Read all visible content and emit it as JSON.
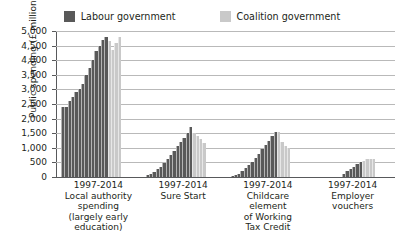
{
  "chart_data": {
    "type": "bar",
    "title": "",
    "subtitle": "",
    "xlabel": "",
    "ylabel": "Public spending (£ millions)",
    "ylim": [
      0,
      5000
    ],
    "ytick_step": 500,
    "grid": true,
    "legend_position": "top-center",
    "period_label": "1997-2014",
    "categories": [
      "Local authority spending (largely early education)",
      "Sure Start",
      "Childcare element of Working Tax Credit",
      "Employer vouchers"
    ],
    "category_lines": [
      [
        "Local authority",
        "spending",
        "(largely early",
        "education)"
      ],
      [
        "Sure Start"
      ],
      [
        "Childcare",
        "element",
        "of Working",
        "Tax Credit"
      ],
      [
        "Employer",
        "vouchers"
      ]
    ],
    "series": [
      {
        "name": "Labour government",
        "color": "#595959",
        "years": [
          1997,
          1998,
          1999,
          2000,
          2001,
          2002,
          2003,
          2004,
          2005,
          2006,
          2007,
          2008,
          2009,
          2010
        ]
      },
      {
        "name": "Coalition government",
        "color": "#c9c9c9",
        "years": [
          2011,
          2012,
          2013,
          2014
        ]
      }
    ],
    "groups": [
      {
        "category": "Local authority spending (largely early education)",
        "labour_values": [
          2400,
          2400,
          2600,
          2750,
          2900,
          3000,
          3200,
          3500,
          3750,
          4000,
          4300,
          4500,
          4700,
          4800
        ],
        "coalition_values": [
          4650,
          4350,
          4600,
          4800
        ]
      },
      {
        "category": "Sure Start",
        "labour_values": [
          60,
          110,
          180,
          260,
          360,
          470,
          600,
          760,
          900,
          1050,
          1200,
          1350,
          1500,
          1700
        ],
        "coalition_values": [
          1500,
          1400,
          1300,
          1150
        ]
      },
      {
        "category": "Childcare element of Working Tax Credit",
        "labour_values": [
          30,
          60,
          120,
          200,
          300,
          400,
          520,
          650,
          800,
          950,
          1100,
          1250,
          1400,
          1550
        ],
        "coalition_values": [
          1550,
          1200,
          1050,
          1000
        ]
      },
      {
        "category": "Employer vouchers",
        "labour_values": [
          0,
          0,
          0,
          0,
          0,
          0,
          0,
          0,
          120,
          200,
          280,
          360,
          430,
          500
        ],
        "coalition_values": [
          560,
          600,
          620,
          620
        ]
      }
    ],
    "yticks": [
      "0",
      "500",
      "1,000",
      "1,500",
      "2,000",
      "2,500",
      "3,000",
      "3,500",
      "4,000",
      "4,500",
      "5,000"
    ]
  },
  "legend": {
    "entries": [
      {
        "label": "Labour government",
        "color": "#595959"
      },
      {
        "label": "Coalition government",
        "color": "#c9c9c9"
      }
    ]
  }
}
